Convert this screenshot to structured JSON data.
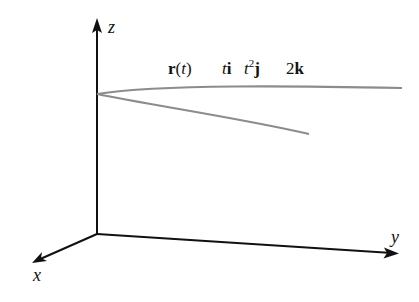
{
  "diagram": {
    "axes": {
      "z_label": "z",
      "y_label": "y",
      "x_label": "x"
    },
    "equation": {
      "parts": [
        {
          "text": "r",
          "style": "bold"
        },
        {
          "text": "(",
          "style": "normal"
        },
        {
          "text": "t",
          "style": "italic"
        },
        {
          "text": ")",
          "style": "normal"
        },
        {
          "text": "t",
          "style": "italic"
        },
        {
          "text": "i",
          "style": "bold"
        },
        {
          "text": "t",
          "style": "italic"
        },
        {
          "text": "2",
          "style": "superscript"
        },
        {
          "text": "j",
          "style": "bold"
        },
        {
          "text": "2",
          "style": "normal"
        },
        {
          "text": "k",
          "style": "bold"
        }
      ],
      "plain": "r(t)  ti  t^2 j  2k"
    },
    "curve": {
      "description": "parabola in plane z = 2, vertex on z-axis",
      "color": "#8c8c8c"
    },
    "colors": {
      "axis": "#111111",
      "curve": "#8c8c8c",
      "background": "#ffffff"
    }
  }
}
